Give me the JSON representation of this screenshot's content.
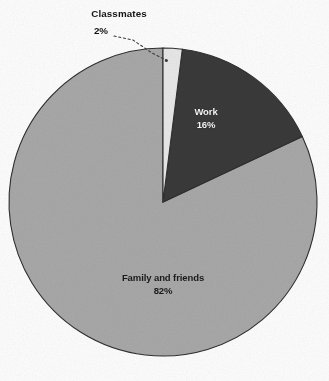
{
  "chart_data": {
    "type": "pie",
    "title": "",
    "subtitle": "",
    "xlabel": "",
    "ylabel": "",
    "legend_position": "none",
    "grid": false,
    "units": "percent",
    "total": 100,
    "start_angle_deg": 0,
    "direction": "clockwise",
    "categories": [
      "Classmates",
      "Work",
      "Family and friends"
    ],
    "values": [
      2,
      16,
      82
    ],
    "slices": [
      {
        "label": "Classmates",
        "value": 2,
        "percent_text": "2%",
        "color": "#e8e8e8",
        "label_placement": "outside",
        "leader_line": true,
        "text_color": "#141414"
      },
      {
        "label": "Work",
        "value": 16,
        "percent_text": "16%",
        "color": "#3a3a3a",
        "label_placement": "inside",
        "leader_line": false,
        "text_color": "#f2f2f2"
      },
      {
        "label": "Family and friends",
        "value": 82,
        "percent_text": "82%",
        "color": "#a8a8a8",
        "label_placement": "inside",
        "leader_line": false,
        "text_color": "#1b1b1b"
      }
    ]
  },
  "geometry": {
    "center_x": 163,
    "center_y": 202,
    "radius": 154
  },
  "colors": {
    "background": "#fdfdfd",
    "slice_light": "#e8e8e8",
    "slice_dark": "#3a3a3a",
    "slice_gray": "#a8a8a8",
    "outline": "#2f2f2f",
    "leader_line": "#3c3c3c"
  },
  "caption": {
    "text": ""
  }
}
